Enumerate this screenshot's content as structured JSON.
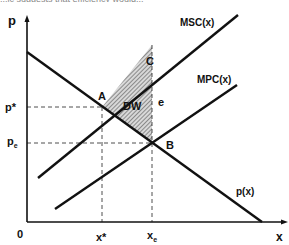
{
  "top_text_cut": "...ic suggests that efficiency would...",
  "axes": {
    "y_label": "p",
    "x_label": "x",
    "origin_label": "0"
  },
  "curves": {
    "msc_label": "MSC(x)",
    "mpc_label": "MPC(x)",
    "demand_label": "p(x)"
  },
  "points": {
    "a": "A",
    "b": "B",
    "c": "C",
    "e": "e"
  },
  "region": {
    "deadweight_label": "DW"
  },
  "ticks": {
    "p_star": "p*",
    "p_e": "p",
    "p_e_sub": "e",
    "x_star": "x*",
    "x_e": "x",
    "x_e_sub": "e"
  },
  "colors": {
    "line": "#111111",
    "hatch": "#555555",
    "background": "#ffffff"
  }
}
